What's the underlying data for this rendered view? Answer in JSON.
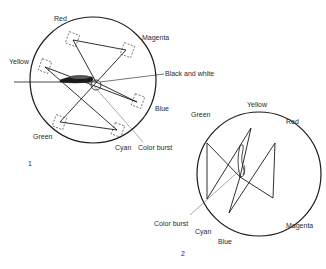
{
  "figure1": {
    "number": "1",
    "labels": {
      "red": "Red",
      "magenta": "Magenta",
      "yellow": "Yellow",
      "black_and_white": "Black and white",
      "blue": "Blue",
      "green": "Green",
      "cyan": "Cyan",
      "color_burst": "Color burst"
    }
  },
  "figure2": {
    "number": "2",
    "labels": {
      "green": "Green",
      "yellow": "Yellow",
      "red": "Red",
      "color_burst": "Color burst",
      "cyan": "Cyan",
      "blue": "Blue",
      "magenta": "Magenta"
    }
  },
  "colors": {
    "stroke": "#1a1a1a",
    "text": "#2a2a2a",
    "background": "#ffffff"
  }
}
